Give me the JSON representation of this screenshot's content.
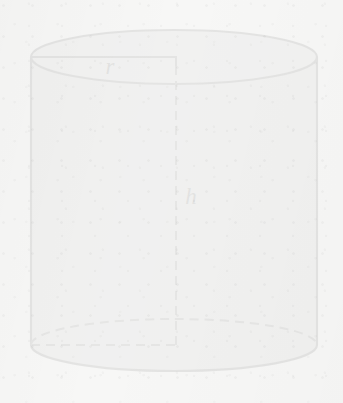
{
  "figure": {
    "kind": "solid-geometry-diagram",
    "shape_name": "cylinder",
    "labels": {
      "radius": "r",
      "height": "h"
    },
    "colors": {
      "background": "#f7f7f6",
      "body_fill": "#b9b9b9",
      "top_face_fill": "#c2c2c2",
      "outline": "#3a3a3a",
      "construction_line": "#4a4a4a",
      "label_text": "#2b2b2b"
    },
    "geometry": {
      "canvas_width": 343,
      "canvas_height": 403,
      "center_x": 174,
      "semi_axis_x": 143,
      "top_ellipse_center_y": 57,
      "top_ellipse_semi_axis_y": 27,
      "bottom_ellipse_center_y": 345,
      "bottom_ellipse_semi_axis_y": 26,
      "left_edge_x": 31,
      "right_edge_x": 317,
      "axis_line_x": 176,
      "radius_line_y": 57,
      "height_line_top_y": 66,
      "height_line_bottom_y": 345
    },
    "label_positions": {
      "radius": {
        "x": 110,
        "y": 74
      },
      "height": {
        "x": 191,
        "y": 204
      }
    },
    "line_styles": {
      "outline_width": 2.1,
      "construction_width": 2.0,
      "dash_pattern": "9 6"
    }
  }
}
